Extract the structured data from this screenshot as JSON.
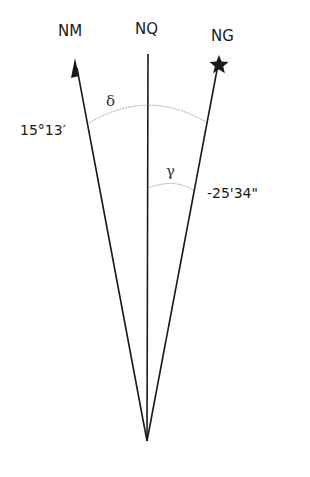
{
  "diagram": {
    "title": "",
    "directions": [
      {
        "id": "nm",
        "label": "NM",
        "meaning": "magnetic north",
        "marker": "arrowhead"
      },
      {
        "id": "nq",
        "label": "NQ",
        "meaning": "grid/quadrillage north",
        "marker": "none"
      },
      {
        "id": "ng",
        "label": "NG",
        "meaning": "geographic north",
        "marker": "star"
      }
    ],
    "angles": [
      {
        "id": "delta",
        "symbol": "δ",
        "value": "15°13′",
        "between": [
          "NM",
          "NG"
        ]
      },
      {
        "id": "gamma",
        "symbol": "γ",
        "value": "-25'34\"",
        "between": [
          "NQ",
          "NG"
        ]
      }
    ],
    "colors": {
      "line": "#1a1a1a",
      "arc": "#9a9a9a",
      "background": "#ffffff"
    }
  }
}
